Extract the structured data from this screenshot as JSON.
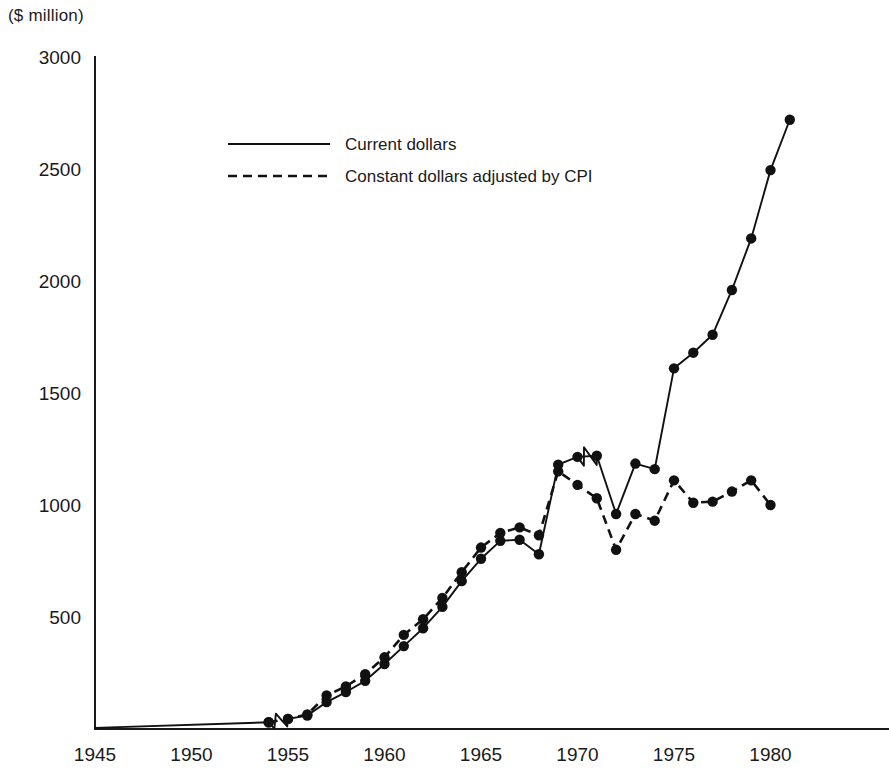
{
  "unit_label": "($ million)",
  "legend": {
    "position": "inside-top-left",
    "items": [
      {
        "label": "Current dollars",
        "style": "solid"
      },
      {
        "label": "Constant dollars adjusted by CPI",
        "style": "dashed"
      }
    ]
  },
  "axes": {
    "y": {
      "label": "($ million)",
      "ticks": [
        "3000",
        "2500",
        "2000",
        "1500",
        "1000",
        "500"
      ],
      "tick_values": [
        3000,
        2500,
        2000,
        1500,
        1000,
        500
      ],
      "min": 0,
      "max": 3000
    },
    "x": {
      "ticks": [
        "1945",
        "1950",
        "1955",
        "1960",
        "1965",
        "1970",
        "1975",
        "1980"
      ],
      "tick_values": [
        1945,
        1950,
        1955,
        1960,
        1965,
        1970,
        1975,
        1980
      ],
      "min": 1945,
      "max": 1982
    }
  },
  "colors": {
    "ink": "#111111",
    "background": "#ffffff"
  },
  "chart_data": {
    "type": "line",
    "title": "",
    "subtitle": "",
    "xlabel": "",
    "ylabel": "($ million)",
    "xlim": [
      1945,
      1982
    ],
    "ylim": [
      0,
      3000
    ],
    "grid": false,
    "legend_position": "inside-top-left",
    "annotations": [
      {
        "type": "axis-break-zigzag",
        "series": "Current dollars",
        "between_x": [
          1954,
          1955
        ]
      },
      {
        "type": "axis-break-zigzag",
        "series": "Current dollars",
        "between_x": [
          1969,
          1971
        ]
      }
    ],
    "series": [
      {
        "name": "Current dollars",
        "style": "solid",
        "markers": true,
        "x": [
          1945,
          1954,
          1955,
          1956,
          1957,
          1958,
          1959,
          1960,
          1961,
          1962,
          1963,
          1964,
          1965,
          1966,
          1967,
          1968,
          1969,
          1970,
          1971,
          1972,
          1973,
          1974,
          1975,
          1976,
          1977,
          1978,
          1979,
          1980,
          1981
        ],
        "values": [
          5,
          30,
          45,
          60,
          120,
          165,
          215,
          290,
          370,
          450,
          545,
          660,
          760,
          840,
          845,
          780,
          1180,
          1215,
          1220,
          960,
          1185,
          1160,
          1610,
          1680,
          1760,
          1960,
          2190,
          2495,
          2720
        ]
      },
      {
        "name": "Constant dollars adjusted by CPI",
        "style": "dashed",
        "markers": true,
        "x": [
          1954,
          1955,
          1956,
          1957,
          1958,
          1959,
          1960,
          1961,
          1962,
          1963,
          1964,
          1965,
          1966,
          1967,
          1968,
          1969,
          1970,
          1971,
          1972,
          1973,
          1974,
          1975,
          1976,
          1977,
          1978,
          1979,
          1980
        ],
        "values": [
          30,
          45,
          65,
          150,
          190,
          245,
          320,
          420,
          490,
          585,
          700,
          810,
          875,
          900,
          865,
          1150,
          1090,
          1030,
          800,
          960,
          930,
          1110,
          1010,
          1015,
          1060,
          1110,
          1000
        ]
      }
    ]
  }
}
